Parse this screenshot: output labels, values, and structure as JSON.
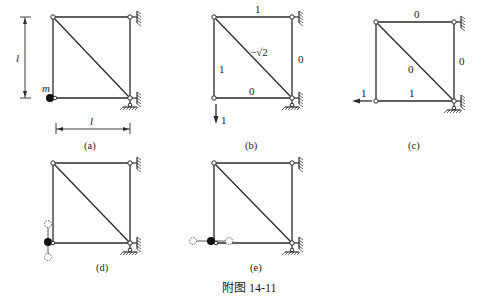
{
  "figure_caption": "附图 14-11",
  "panels": {
    "a": {
      "caption": "(a)",
      "mass_label": "m",
      "dim_vertical_label": "l",
      "dim_horizontal_label": "l"
    },
    "b": {
      "caption": "(b)",
      "member_forces": {
        "top": "1",
        "diagonal": "−√2",
        "left": "1",
        "right": "0",
        "bottom": "0"
      },
      "load_label": "1",
      "load_direction": "down"
    },
    "c": {
      "caption": "(c)",
      "member_forces": {
        "top": "0",
        "diagonal": "0",
        "right": "0",
        "bottom": "1"
      },
      "load_label": "1",
      "load_direction": "left"
    },
    "d": {
      "caption": "(d)",
      "mode": "vertical vibration of mass"
    },
    "e": {
      "caption": "(e)",
      "mode": "horizontal vibration of mass"
    }
  },
  "icons": {
    "pin_node": "hinge-node-icon",
    "mass": "lumped-mass-icon",
    "wall_support": "fixed-wall-support-icon",
    "ground_support": "ground-pin-support-icon"
  }
}
